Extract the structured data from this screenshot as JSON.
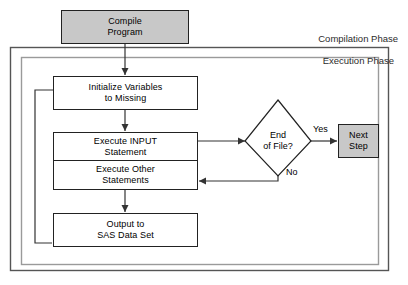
{
  "diagram": {
    "phases": [
      {
        "id": "compilation",
        "label": "Compilation Phase"
      },
      {
        "id": "execution",
        "label": "Execution Phase"
      }
    ],
    "nodes": [
      {
        "id": "compile-program",
        "shape": "process",
        "style": "shaded",
        "line1": "Compile",
        "line2": "Program"
      },
      {
        "id": "initialize-variables",
        "shape": "process",
        "style": "plain",
        "line1": "Initialize Variables",
        "line2": "to Missing"
      },
      {
        "id": "execute-input-statement",
        "shape": "process",
        "style": "plain",
        "line1": "Execute INPUT",
        "line2": "Statement"
      },
      {
        "id": "execute-other-statements",
        "shape": "process",
        "style": "plain",
        "line1": "Execute Other",
        "line2": "Statements"
      },
      {
        "id": "output-to-sas-data-set",
        "shape": "process",
        "style": "plain",
        "line1": "Output to",
        "line2": "SAS Data Set"
      },
      {
        "id": "end-of-file",
        "shape": "decision",
        "style": "plain",
        "line1": "End",
        "line2": "of File?"
      },
      {
        "id": "next-step",
        "shape": "process",
        "style": "shaded",
        "line1": "Next",
        "line2": "Step"
      }
    ],
    "edge_labels": [
      {
        "id": "yes",
        "label": "Yes"
      },
      {
        "id": "no",
        "label": "No"
      }
    ],
    "colors": {
      "shaded_fill": "#c8c8c8",
      "node_stroke": "#222222",
      "connector": "#333333",
      "outer_border": "#555555",
      "inner_border": "#9a9a9a",
      "background": "#ffffff",
      "text": "#000000"
    }
  }
}
